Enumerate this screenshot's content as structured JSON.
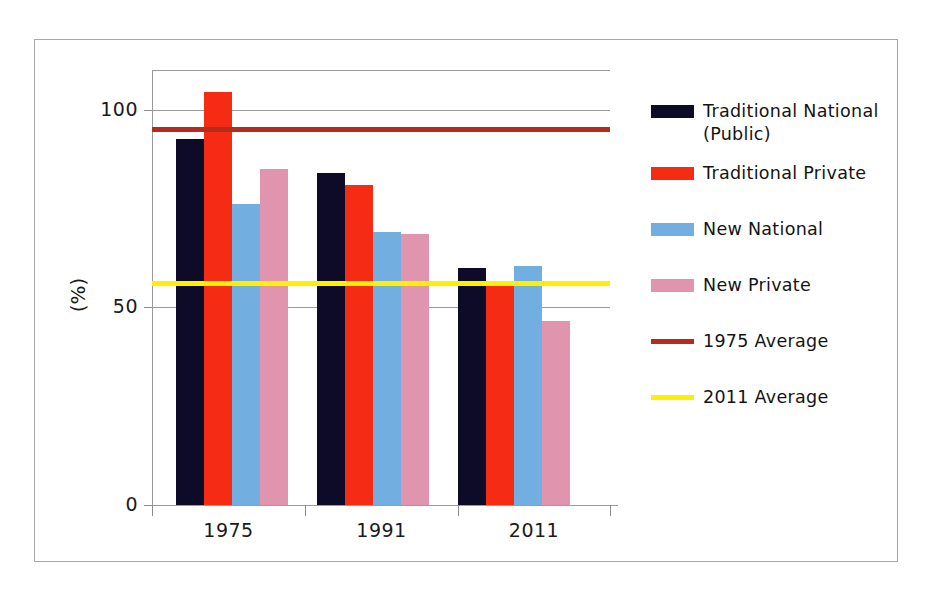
{
  "chart_data": {
    "type": "bar",
    "title": "",
    "xlabel": "",
    "ylabel": "(%)",
    "categories": [
      "1975",
      "1991",
      "2011"
    ],
    "ytick_labels": [
      "0",
      "50",
      "100"
    ],
    "yticks": [
      0,
      50,
      100
    ],
    "ylim": [
      0,
      110
    ],
    "grid": true,
    "legend_position": "right",
    "series": [
      {
        "name": "Traditional National (Public)",
        "legend_label": "Traditional National\n(Public)",
        "color": "#0D0B28",
        "values": [
          92.5,
          84.0,
          60.0
        ]
      },
      {
        "name": "Traditional Private",
        "legend_label": "Traditional Private",
        "color": "#F52B13",
        "values": [
          104.5,
          81.0,
          56.5
        ]
      },
      {
        "name": "New National",
        "legend_label": "New National",
        "color": "#72AEE0",
        "values": [
          76.0,
          69.0,
          60.5
        ]
      },
      {
        "name": "New Private",
        "legend_label": "New Private",
        "color": "#E094AE",
        "values": [
          85.0,
          68.5,
          46.5
        ]
      }
    ],
    "reference_lines": [
      {
        "name": "1975 Average",
        "legend_label": "1975 Average",
        "color": "#B52B20",
        "value": 95.0,
        "width_px": 5
      },
      {
        "name": "2011 Average",
        "legend_label": "2011 Average",
        "color": "#FFF000",
        "value": 56.0,
        "width_px": 5
      }
    ]
  },
  "axis": {
    "y_title": "(%)",
    "y_tick_0": "0",
    "y_tick_50": "50",
    "y_tick_100": "100",
    "x_tick_1": "1975",
    "x_tick_2": "1991",
    "x_tick_3": "2011"
  },
  "legend": {
    "items": [
      {
        "label": "Traditional National\n(Public)",
        "color": "#0D0B28",
        "kind": "bar"
      },
      {
        "label": "Traditional Private",
        "color": "#F52B13",
        "kind": "bar"
      },
      {
        "label": "New National",
        "color": "#72AEE0",
        "kind": "bar"
      },
      {
        "label": "New Private",
        "color": "#E094AE",
        "kind": "bar"
      },
      {
        "label": "1975 Average",
        "color": "#B52B20",
        "kind": "line"
      },
      {
        "label": "2011 Average",
        "color": "#FFF000",
        "kind": "line"
      }
    ]
  },
  "colors": {
    "traditional_national": "#0D0B28",
    "traditional_private": "#F52B13",
    "new_national": "#72AEE0",
    "new_private": "#E094AE",
    "avg_1975": "#B52B20",
    "avg_2011": "#FFF000",
    "grid": "#9b9b9b",
    "frame": "#a8a8a8",
    "text": "#1a1a1a",
    "background": "#ffffff"
  }
}
